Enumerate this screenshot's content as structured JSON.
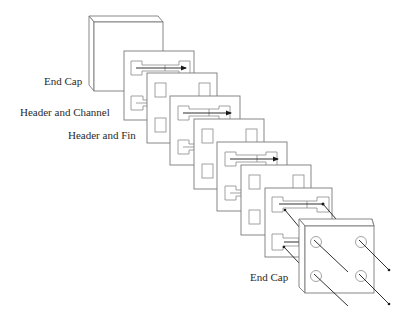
{
  "figure": {
    "type": "exploded-view",
    "labels": {
      "end_cap_top": "End Cap",
      "header_and_channel": "Header and Channel",
      "header_and_fin": "Header and Fin",
      "end_cap_bottom": "End Cap"
    },
    "stack": [
      {
        "kind": "end-cap",
        "position": "top-left"
      },
      {
        "kind": "header-and-channel",
        "index": 1
      },
      {
        "kind": "header-and-fin",
        "index": 2
      },
      {
        "kind": "header-and-channel",
        "index": 3
      },
      {
        "kind": "header-and-fin",
        "index": 4
      },
      {
        "kind": "header-and-channel",
        "index": 5
      },
      {
        "kind": "header-and-fin",
        "index": 6
      },
      {
        "kind": "header-and-channel",
        "index": 7
      },
      {
        "kind": "end-cap",
        "position": "bottom-right",
        "ports": 4
      }
    ],
    "colors": {
      "line": "#7a7a7a",
      "arrow": "#1a1a1a",
      "text": "#2a2a2a",
      "background": "#ffffff"
    }
  }
}
